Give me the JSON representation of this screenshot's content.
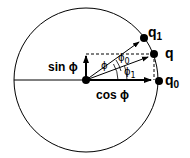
{
  "diagram": {
    "type": "phasor-unit-circle",
    "labels": {
      "sin": "sin ϕ",
      "cos": "cos ϕ",
      "phi": "ϕ",
      "phi0_base": "ϕ",
      "phi0_sub": "0",
      "phi1_base": "ϕ",
      "phi1_sub": "1",
      "q": "q",
      "q0_base": "q",
      "q0_sub": "0",
      "q1_base": "q",
      "q1_sub": "1"
    },
    "points": {
      "center": [
        86,
        80
      ],
      "q": [
        154,
        54
      ],
      "q0": [
        159,
        81
      ],
      "q1": [
        144,
        38
      ]
    },
    "circle": {
      "cx": 86,
      "cy": 80,
      "r": 73
    },
    "colors": {
      "stroke": "#000000",
      "background": "#ffffff"
    }
  }
}
